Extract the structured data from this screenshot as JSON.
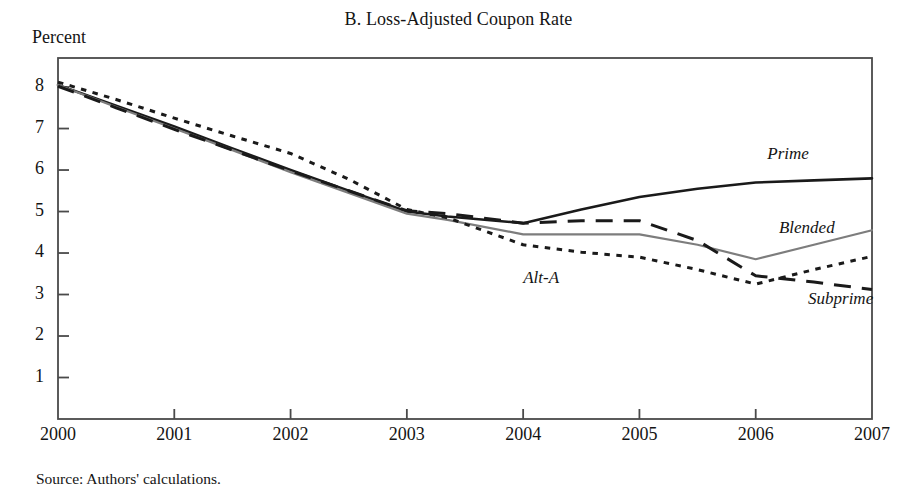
{
  "figure": {
    "panel_title": "B. Loss-Adjusted Coupon Rate",
    "y_axis_unit_label": "Percent",
    "source_note": "Source: Authors' calculations."
  },
  "labels": {
    "prime": "Prime",
    "blended": "Blended",
    "alt_a": "Alt-A",
    "subprime": "Subprime"
  },
  "colors": {
    "prime": "#1a1a1a",
    "blended": "#7d7d7d",
    "alt_a": "#1a1a1a",
    "subprime": "#1a1a1a",
    "axis": "#4a4a4a",
    "background": "#ffffff"
  },
  "chart_data": {
    "type": "line",
    "title": "B. Loss-Adjusted Coupon Rate",
    "xlabel": "",
    "ylabel": "Percent",
    "xlim": [
      2000,
      2007
    ],
    "ylim": [
      0,
      8.7
    ],
    "grid": false,
    "legend": "inline-annotations",
    "x_ticks": [
      "2000",
      "2001",
      "2002",
      "2003",
      "2004",
      "2005",
      "2006",
      "2007"
    ],
    "y_ticks": [
      "1",
      "2",
      "3",
      "4",
      "5",
      "6",
      "7",
      "8"
    ],
    "x": [
      2000,
      2000.5,
      2001,
      2001.5,
      2002,
      2002.5,
      2003,
      2003.35,
      2004,
      2004.5,
      2005,
      2005.5,
      2006,
      2006.5,
      2007
    ],
    "series": [
      {
        "name": "Prime",
        "style": "solid",
        "color": "#1a1a1a",
        "width": 2.6,
        "values": [
          8.05,
          7.55,
          7.05,
          6.52,
          6.0,
          5.5,
          5.0,
          4.88,
          4.72,
          5.05,
          5.35,
          5.55,
          5.7,
          5.75,
          5.8
        ]
      },
      {
        "name": "Blended",
        "style": "solid",
        "color": "#7d7d7d",
        "width": 2.2,
        "values": [
          8.05,
          7.52,
          7.0,
          6.48,
          5.95,
          5.45,
          4.95,
          4.8,
          4.45,
          4.45,
          4.45,
          4.2,
          3.85,
          4.2,
          4.55
        ]
      },
      {
        "name": "Alt-A",
        "style": "dashed",
        "color": "#1a1a1a",
        "width": 3.0,
        "values": [
          8.02,
          7.5,
          6.98,
          6.48,
          5.98,
          5.5,
          5.02,
          4.95,
          4.72,
          4.78,
          4.78,
          4.3,
          3.45,
          3.3,
          3.12
        ]
      },
      {
        "name": "Subprime",
        "style": "dotted",
        "color": "#1a1a1a",
        "width": 3.0,
        "values": [
          8.12,
          7.7,
          7.25,
          6.82,
          6.4,
          5.78,
          5.05,
          4.85,
          4.2,
          4.02,
          3.9,
          3.6,
          3.25,
          3.6,
          3.92
        ]
      }
    ],
    "annotations": [
      {
        "text": "Prime",
        "x": 2006.1,
        "y": 6.35
      },
      {
        "text": "Blended",
        "x": 2006.2,
        "y": 4.55
      },
      {
        "text": "Alt-A",
        "x": 2004.0,
        "y": 3.35
      },
      {
        "text": "Subprime",
        "x": 2006.45,
        "y": 2.85
      }
    ]
  }
}
